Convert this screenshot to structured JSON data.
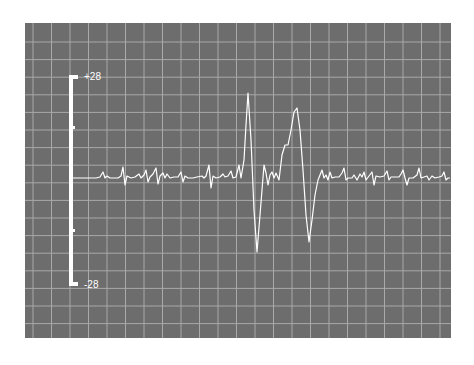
{
  "chart_data": {
    "type": "line",
    "title": "",
    "xlabel": "",
    "ylabel": "",
    "scale_bar": {
      "top_label": "+28",
      "bottom_label": "-28",
      "ticks": 3
    },
    "ylim": [
      -28,
      28
    ],
    "grid": true,
    "legend": null,
    "background": "#6d6d6d",
    "grid_color": "#a9a9a9",
    "trace_color": "#ffffff",
    "baseline_y_px": 178,
    "trace_points_px": [
      [
        72,
        178
      ],
      [
        96,
        178
      ],
      [
        100,
        177
      ],
      [
        103,
        172
      ],
      [
        105,
        178
      ],
      [
        107,
        176
      ],
      [
        110,
        178
      ],
      [
        114,
        178
      ],
      [
        118,
        178
      ],
      [
        121,
        176
      ],
      [
        123,
        167
      ],
      [
        125,
        185
      ],
      [
        127,
        176
      ],
      [
        131,
        178
      ],
      [
        135,
        177
      ],
      [
        139,
        174
      ],
      [
        141,
        178
      ],
      [
        144,
        175
      ],
      [
        146,
        170
      ],
      [
        148,
        182
      ],
      [
        150,
        177
      ],
      [
        153,
        174
      ],
      [
        156,
        168
      ],
      [
        158,
        184
      ],
      [
        160,
        176
      ],
      [
        163,
        173
      ],
      [
        165,
        178
      ],
      [
        167,
        174
      ],
      [
        170,
        178
      ],
      [
        174,
        177
      ],
      [
        178,
        177
      ],
      [
        181,
        172
      ],
      [
        183,
        182
      ],
      [
        185,
        176
      ],
      [
        188,
        178
      ],
      [
        193,
        178
      ],
      [
        197,
        177
      ],
      [
        202,
        176
      ],
      [
        204,
        178
      ],
      [
        206,
        176
      ],
      [
        209,
        165
      ],
      [
        211,
        188
      ],
      [
        213,
        176
      ],
      [
        216,
        178
      ],
      [
        220,
        177
      ],
      [
        223,
        174
      ],
      [
        225,
        177
      ],
      [
        228,
        176
      ],
      [
        231,
        171
      ],
      [
        233,
        178
      ],
      [
        236,
        177
      ],
      [
        239,
        165
      ],
      [
        241,
        178
      ],
      [
        244,
        160
      ],
      [
        246,
        125
      ],
      [
        248,
        93
      ],
      [
        251,
        140
      ],
      [
        254,
        210
      ],
      [
        257,
        252
      ],
      [
        260,
        215
      ],
      [
        264,
        165
      ],
      [
        266,
        173
      ],
      [
        268,
        185
      ],
      [
        270,
        175
      ],
      [
        272,
        172
      ],
      [
        274,
        178
      ],
      [
        276,
        173
      ],
      [
        279,
        180
      ],
      [
        282,
        155
      ],
      [
        285,
        145
      ],
      [
        288,
        145
      ],
      [
        291,
        130
      ],
      [
        294,
        112
      ],
      [
        297,
        108
      ],
      [
        300,
        130
      ],
      [
        303,
        170
      ],
      [
        306,
        215
      ],
      [
        309,
        242
      ],
      [
        312,
        220
      ],
      [
        315,
        195
      ],
      [
        318,
        180
      ],
      [
        320,
        175
      ],
      [
        322,
        170
      ],
      [
        324,
        178
      ],
      [
        326,
        175
      ],
      [
        328,
        180
      ],
      [
        330,
        172
      ],
      [
        332,
        178
      ],
      [
        335,
        177
      ],
      [
        339,
        177
      ],
      [
        342,
        173
      ],
      [
        344,
        168
      ],
      [
        346,
        180
      ],
      [
        348,
        178
      ],
      [
        352,
        178
      ],
      [
        354,
        175
      ],
      [
        357,
        180
      ],
      [
        360,
        174
      ],
      [
        362,
        177
      ],
      [
        364,
        172
      ],
      [
        366,
        180
      ],
      [
        369,
        176
      ],
      [
        372,
        172
      ],
      [
        374,
        185
      ],
      [
        376,
        176
      ],
      [
        380,
        177
      ],
      [
        384,
        176
      ],
      [
        387,
        171
      ],
      [
        389,
        180
      ],
      [
        391,
        177
      ],
      [
        395,
        177
      ],
      [
        399,
        177
      ],
      [
        401,
        174
      ],
      [
        403,
        170
      ],
      [
        405,
        178
      ],
      [
        407,
        185
      ],
      [
        409,
        178
      ],
      [
        413,
        178
      ],
      [
        417,
        175
      ],
      [
        419,
        168
      ],
      [
        421,
        178
      ],
      [
        424,
        177
      ],
      [
        427,
        176
      ],
      [
        429,
        180
      ],
      [
        432,
        176
      ],
      [
        435,
        178
      ],
      [
        439,
        177
      ],
      [
        442,
        176
      ],
      [
        444,
        172
      ],
      [
        446,
        180
      ],
      [
        448,
        178
      ],
      [
        450,
        178
      ]
    ]
  }
}
